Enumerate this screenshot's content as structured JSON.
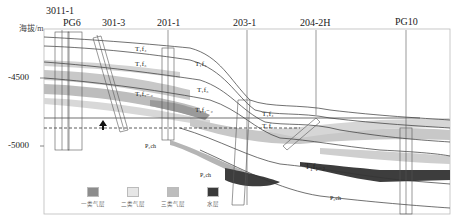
{
  "axis": {
    "ylabel": "海拔/m",
    "ticks": [
      "-4500",
      "-5000"
    ]
  },
  "wells": [
    {
      "name": "3011-1"
    },
    {
      "name": "PG6"
    },
    {
      "name": "301-3"
    },
    {
      "name": "201-1"
    },
    {
      "name": "203-1"
    },
    {
      "name": "204-2H"
    },
    {
      "name": "PG10"
    }
  ],
  "formations": {
    "f4": "T₁f₄",
    "f3": "T₁f₃",
    "f12": "T₁f₁₋₂",
    "p2ch": "P₂ch"
  },
  "legend": [
    {
      "label": "一类气层",
      "color": "#8c8c8c"
    },
    {
      "label": "二类气层",
      "color": "#e6e6e6"
    },
    {
      "label": "三类气层",
      "color": "#bdbdbd"
    },
    {
      "label": "水层",
      "color": "#3a3a3a"
    }
  ]
}
